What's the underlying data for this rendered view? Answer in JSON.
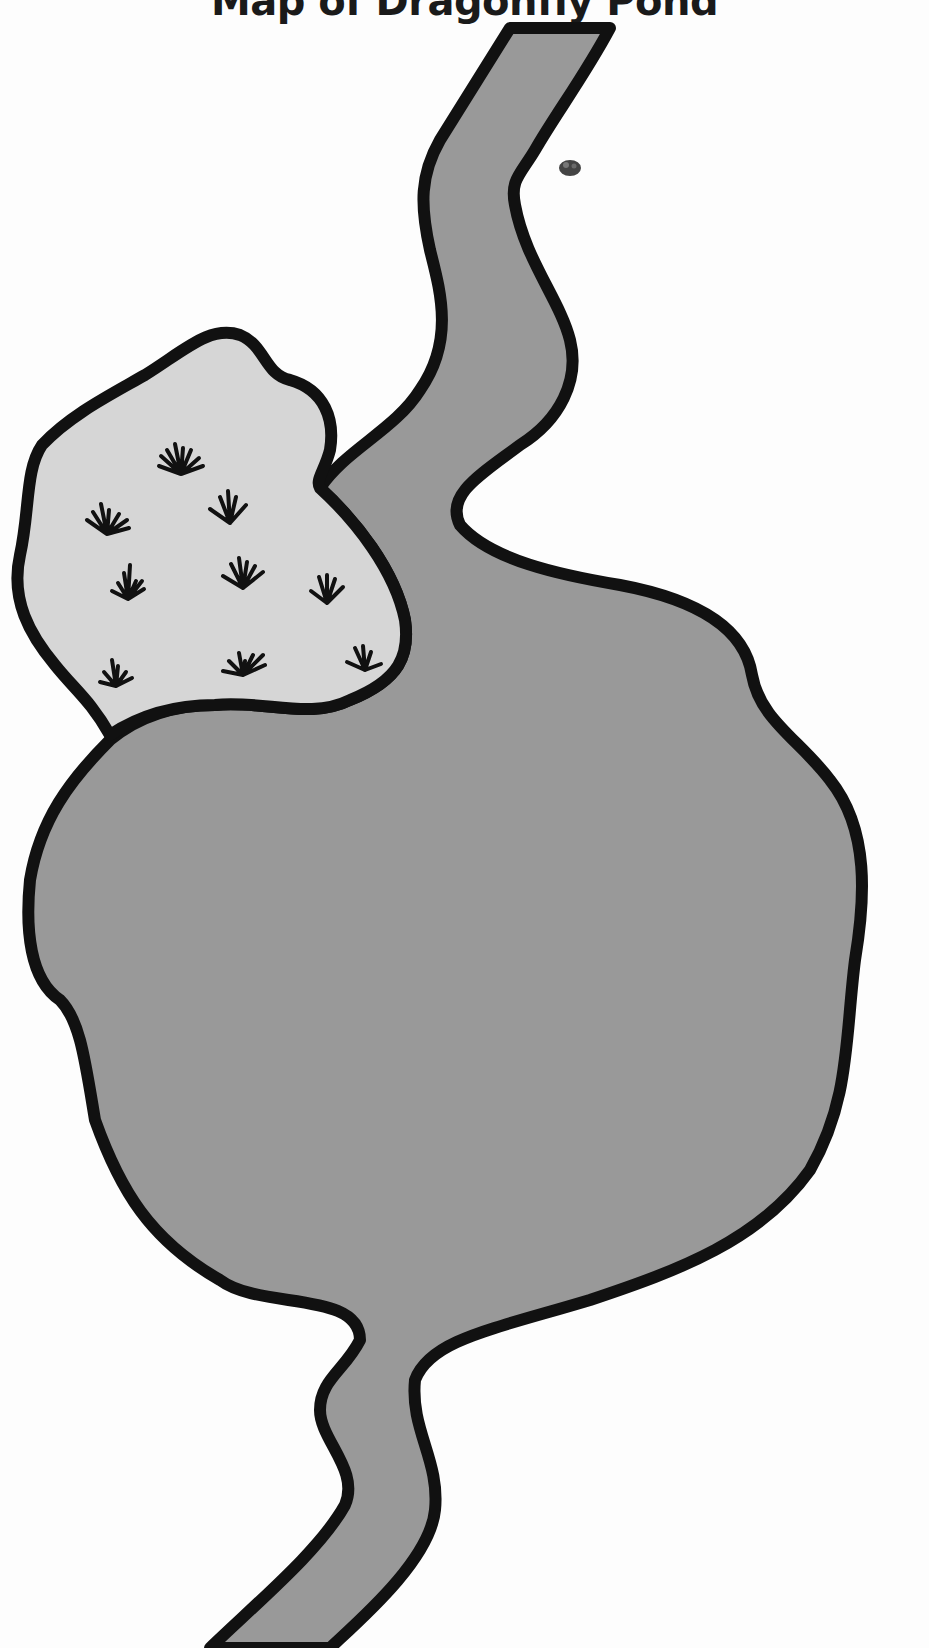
{
  "title": "Map of Dragonfly Pond",
  "colors": {
    "water": "#999999",
    "marsh": "#d6d6d6",
    "land": "#fdfdfd",
    "outline": "#111111"
  },
  "features": {
    "pond": {
      "label": "pond"
    },
    "stream_north": {
      "label": "inflow stream (north)"
    },
    "stream_south": {
      "label": "outflow stream (south)"
    },
    "marsh": {
      "label": "marsh area",
      "reed_count": 9
    },
    "rock": {
      "label": "small rock"
    }
  }
}
